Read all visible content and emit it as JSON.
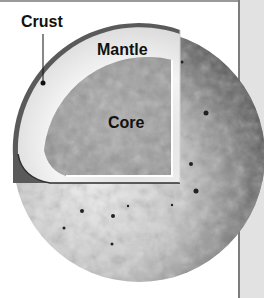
{
  "figure": {
    "type": "planet-interior-cutaway",
    "labels": {
      "crust": "Crust",
      "mantle": "Mantle",
      "core": "Core"
    },
    "layers": [
      {
        "name": "Crust",
        "color": "#555555"
      },
      {
        "name": "Mantle",
        "color": "#e6e6e6"
      },
      {
        "name": "Core",
        "color": "#9c9c9c"
      }
    ],
    "surface_color": "#bdbdbd",
    "shadow_color": "#3a3a3a",
    "background_color": "#ffffff",
    "side_panel_color": "#e2e2e2"
  }
}
